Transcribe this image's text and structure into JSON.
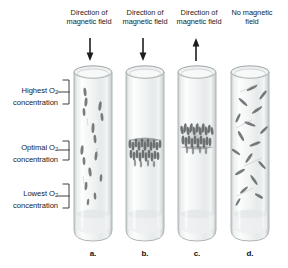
{
  "figure": {
    "background_color": "#ffffff",
    "glass_color": "#d8dcdc",
    "bacteria_color": "#6b6f6f"
  },
  "column_headers": [
    {
      "id": "a",
      "line1": "Direction of",
      "line2": "magnetic field",
      "arrow": "down-arrow-icon"
    },
    {
      "id": "b",
      "line1": "Direction of",
      "line2": "magnetic field",
      "arrow": "down-arrow-icon"
    },
    {
      "id": "c",
      "line1": "Direction of",
      "line2": "magnetic field",
      "arrow": "up-arrow-icon"
    },
    {
      "id": "d",
      "line1": "No magnetic",
      "line2": "field",
      "arrow": "none"
    }
  ],
  "side_labels": [
    {
      "id": "highest",
      "line1": "Highest O",
      "sub": "2",
      "line2": "concentration"
    },
    {
      "id": "optimal",
      "line1": "Optimal O",
      "sub": "2",
      "line2": "concentration"
    },
    {
      "id": "lowest",
      "line1": "Lowest O",
      "sub": "2",
      "line2": "concentration"
    }
  ],
  "tube_labels": [
    {
      "id": "a",
      "text": "a."
    },
    {
      "id": "b",
      "text": "b."
    },
    {
      "id": "c",
      "text": "c."
    },
    {
      "id": "d",
      "text": "d."
    }
  ],
  "tubes": [
    {
      "id": "a",
      "caption": "a.",
      "field": "down",
      "distribution": "scattered-vertical-aligned",
      "description": "Bacteria spread along the tube, aligned vertically with the field"
    },
    {
      "id": "b",
      "caption": "b.",
      "field": "down",
      "distribution": "dense-band-mid",
      "description": "Dense band of bacteria at the optimal O2 level, vertically aligned"
    },
    {
      "id": "c",
      "caption": "c.",
      "field": "up",
      "distribution": "dense-band-upper-mid",
      "description": "Dense band of bacteria slightly above the optimal O2 level"
    },
    {
      "id": "d",
      "caption": "d.",
      "field": "none",
      "distribution": "random-orientation",
      "description": "Bacteria randomly oriented and scattered throughout the tube"
    }
  ]
}
